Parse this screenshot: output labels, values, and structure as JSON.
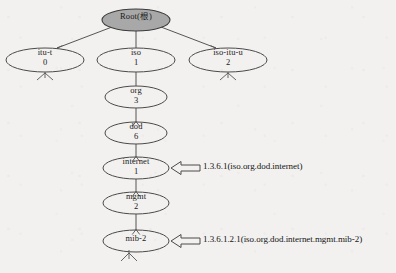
{
  "diagram": {
    "type": "tree",
    "background_color": "#f2f1ef",
    "stroke_color": "#444444",
    "root_fill_color": "#a8a8a8",
    "node_fill_color": "#f2f1ef",
    "text_color": "#1a1a1a"
  },
  "nodes": [
    {
      "id": "root",
      "name": "Root(根)",
      "value": "",
      "cx": 136,
      "cy": 20,
      "rx": 34,
      "ry": 11,
      "filled": true,
      "has_child_mark": false
    },
    {
      "id": "itu-t",
      "name": "itu-t",
      "value": "0",
      "cx": 45,
      "cy": 60,
      "rx": 39,
      "ry": 12,
      "filled": false,
      "has_child_mark": true
    },
    {
      "id": "iso",
      "name": "iso",
      "value": "1",
      "cx": 136,
      "cy": 60,
      "rx": 39,
      "ry": 12,
      "filled": false,
      "has_child_mark": false
    },
    {
      "id": "iso-itu-u",
      "name": "iso-itu-u",
      "value": "2",
      "cx": 228,
      "cy": 60,
      "rx": 39,
      "ry": 12,
      "filled": false,
      "has_child_mark": true
    },
    {
      "id": "org",
      "name": "org",
      "value": "3",
      "cx": 136,
      "cy": 97,
      "rx": 31,
      "ry": 11,
      "filled": false,
      "has_child_mark": false
    },
    {
      "id": "dod",
      "name": "dod",
      "value": "6",
      "cx": 136,
      "cy": 133,
      "rx": 31,
      "ry": 11,
      "filled": false,
      "has_child_mark": false
    },
    {
      "id": "internet",
      "name": "internet",
      "value": "1",
      "cx": 136,
      "cy": 168,
      "rx": 33,
      "ry": 11,
      "filled": false,
      "has_child_mark": false
    },
    {
      "id": "mgmt",
      "name": "mgmt",
      "value": "2",
      "cx": 136,
      "cy": 203,
      "rx": 33,
      "ry": 11,
      "filled": false,
      "has_child_mark": false
    },
    {
      "id": "mib-2",
      "name": "mib-2",
      "value": "",
      "cx": 136,
      "cy": 241,
      "rx": 33,
      "ry": 11,
      "filled": false,
      "has_child_mark": true
    }
  ],
  "edges": [
    {
      "from": "root",
      "to": "itu-t",
      "arrow": true
    },
    {
      "from": "root",
      "to": "iso",
      "arrow": false
    },
    {
      "from": "root",
      "to": "iso-itu-u",
      "arrow": true
    },
    {
      "from": "iso",
      "to": "org",
      "arrow": true
    },
    {
      "from": "org",
      "to": "dod",
      "arrow": true
    },
    {
      "from": "dod",
      "to": "internet",
      "arrow": true
    },
    {
      "from": "internet",
      "to": "mgmt",
      "arrow": true
    },
    {
      "from": "mgmt",
      "to": "mib-2",
      "arrow": true
    }
  ],
  "annotations": [
    {
      "id": "internet-oid",
      "target": "internet",
      "text": "1.3.6.1(iso.org.dod.internet)",
      "arrow_tip_x": 171,
      "arrow_y": 168,
      "text_x": 203,
      "text_y": 162
    },
    {
      "id": "mib2-oid",
      "target": "mib-2",
      "text": "1.3.6.1.2.1(iso.org.dod.internet.mgmt.mib-2)",
      "arrow_tip_x": 171,
      "arrow_y": 241,
      "text_x": 203,
      "text_y": 235
    }
  ]
}
